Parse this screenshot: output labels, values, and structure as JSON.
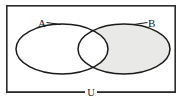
{
  "figure": {
    "kind": "venn-diagram",
    "title_visible": false,
    "background_color": "#ffffff",
    "universe": {
      "label": "U",
      "label_x": 91,
      "label_y": 97,
      "rect": {
        "x": 6,
        "y": 5,
        "width": 170,
        "height": 88
      },
      "border_color": "#2b2b2b",
      "border_width": 1.6,
      "fill": "#ffffff"
    },
    "sets": [
      {
        "id": "A",
        "label": "A",
        "label_x": 41,
        "label_y": 27,
        "cx": 62,
        "cy": 49,
        "rx": 46,
        "ry": 25,
        "stroke": "#1a1a1a",
        "stroke_width": 1.5,
        "shaded": false
      },
      {
        "id": "B",
        "label": "B",
        "label_x": 150,
        "label_y": 27,
        "cx": 124,
        "cy": 49,
        "rx": 46,
        "ry": 25,
        "stroke": "#1a1a1a",
        "stroke_width": 1.5,
        "shaded": true
      }
    ],
    "shading": {
      "region": "B-only",
      "description": "B minus A",
      "color": "#e9e9e7",
      "intersection_shaded": false,
      "a_only_shaded": false,
      "outside_shaded": false
    },
    "leader_lines": [
      {
        "from_label": "A",
        "x1": 46,
        "y1": 23,
        "x2": 60,
        "y2": 24.5
      },
      {
        "from_label": "B",
        "x1": 148,
        "y1": 23,
        "x2": 134,
        "y2": 24.5
      }
    ]
  }
}
